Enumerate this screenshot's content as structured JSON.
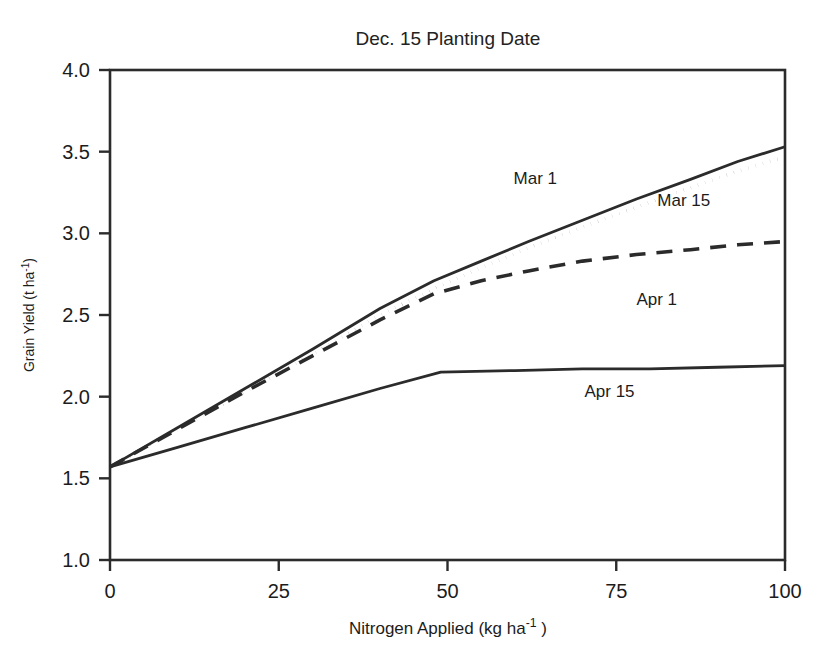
{
  "chart_data": {
    "type": "line",
    "title": "Dec. 15 Planting Date",
    "xlabel": "Nitrogen Applied (kg ha-1 )",
    "xlabel_main": "Nitrogen Applied (kg ha",
    "xlabel_sup": "-1",
    "xlabel_tail": " )",
    "ylabel": "Grain Yield (t ha-1)",
    "ylabel_main": "Grain Yield (t ha",
    "ylabel_sup": "-1",
    "ylabel_tail": ")",
    "xlim": [
      0,
      100
    ],
    "ylim": [
      1.0,
      4.0
    ],
    "xticks": [
      0,
      25,
      50,
      75,
      100
    ],
    "xtick_labels": [
      "0",
      "25",
      "50",
      "75",
      "100"
    ],
    "yticks": [
      1.0,
      1.5,
      2.0,
      2.5,
      3.0,
      3.5,
      4.0
    ],
    "ytick_labels": [
      "1.0",
      "1.5",
      "2.0",
      "2.5",
      "3.0",
      "3.5",
      "4.0"
    ],
    "grid": false,
    "legend_position": "inline-annotations",
    "series": [
      {
        "name": "Mar 1",
        "style": "solid",
        "label_x": 63,
        "label_y": 3.3,
        "x": [
          0,
          10,
          20,
          30,
          40,
          48,
          55,
          62,
          70,
          78,
          86,
          93,
          100
        ],
        "y": [
          1.57,
          1.81,
          2.05,
          2.29,
          2.54,
          2.71,
          2.83,
          2.95,
          3.08,
          3.21,
          3.33,
          3.44,
          3.53
        ]
      },
      {
        "name": "Mar 15",
        "style": "dotted",
        "label_x": 85,
        "label_y": 3.17,
        "x": [
          0,
          10,
          20,
          30,
          40,
          48,
          55,
          62,
          70,
          78,
          86,
          93,
          100
        ],
        "y": [
          1.57,
          1.8,
          2.03,
          2.26,
          2.5,
          2.66,
          2.79,
          2.91,
          3.04,
          3.16,
          3.28,
          3.38,
          3.47
        ]
      },
      {
        "name": "Apr 1",
        "style": "dashed",
        "label_x": 81,
        "label_y": 2.56,
        "x": [
          0,
          10,
          20,
          30,
          40,
          48,
          55,
          62,
          70,
          78,
          86,
          93,
          100
        ],
        "y": [
          1.57,
          1.8,
          2.03,
          2.25,
          2.47,
          2.63,
          2.71,
          2.77,
          2.83,
          2.87,
          2.9,
          2.93,
          2.95
        ]
      },
      {
        "name": "Apr 15",
        "style": "solid",
        "label_x": 74,
        "label_y": 2.0,
        "x": [
          0,
          10,
          20,
          30,
          40,
          49,
          60,
          70,
          80,
          90,
          100
        ],
        "y": [
          1.57,
          1.69,
          1.81,
          1.93,
          2.05,
          2.15,
          2.16,
          2.17,
          2.17,
          2.18,
          2.19
        ]
      }
    ],
    "colors": {
      "line": "#2b2b2b",
      "axis": "#2b2b2b",
      "text": "#1c1c1c",
      "background": "#ffffff"
    }
  }
}
